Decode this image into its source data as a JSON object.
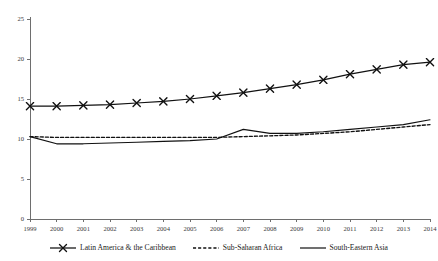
{
  "chart_data": {
    "type": "line",
    "title": "",
    "subtitle": "",
    "xlabel": "",
    "ylabel": "",
    "grid": false,
    "legend_position": "bottom",
    "xlim": [
      1999,
      2014
    ],
    "ylim": [
      0,
      25
    ],
    "yticks": [
      0,
      5,
      10,
      15,
      20,
      25
    ],
    "categories": [
      "1999",
      "2000",
      "2001",
      "2002",
      "2003",
      "2004",
      "2005",
      "2006",
      "2007",
      "2008",
      "2009",
      "2010",
      "2011",
      "2012",
      "2013",
      "2014"
    ],
    "series": [
      {
        "name": "Latin America & the Caribbean",
        "style": "solid-with-x-markers",
        "marker": "x",
        "values": [
          14.1,
          14.1,
          14.2,
          14.3,
          14.5,
          14.7,
          15.0,
          15.4,
          15.8,
          16.3,
          16.8,
          17.4,
          18.1,
          18.7,
          19.3,
          19.6
        ]
      },
      {
        "name": "Sub-Saharan Africa",
        "style": "dashed",
        "marker": "none",
        "values": [
          10.3,
          10.2,
          10.2,
          10.2,
          10.2,
          10.2,
          10.2,
          10.2,
          10.3,
          10.4,
          10.5,
          10.7,
          10.9,
          11.2,
          11.5,
          11.8
        ]
      },
      {
        "name": "South-Eastern Asia",
        "style": "solid",
        "marker": "none",
        "values": [
          10.3,
          9.4,
          9.4,
          9.5,
          9.6,
          9.7,
          9.8,
          10.0,
          11.2,
          10.7,
          10.7,
          10.9,
          11.2,
          11.5,
          11.8,
          12.4
        ]
      }
    ]
  },
  "legend": {
    "items": [
      {
        "label": "Latin America & the Caribbean",
        "swatch": "line-with-x-marker-icon"
      },
      {
        "label": "Sub-Saharan Africa",
        "swatch": "dashed-line-icon"
      },
      {
        "label": "South-Eastern Asia",
        "swatch": "solid-line-icon"
      }
    ]
  }
}
